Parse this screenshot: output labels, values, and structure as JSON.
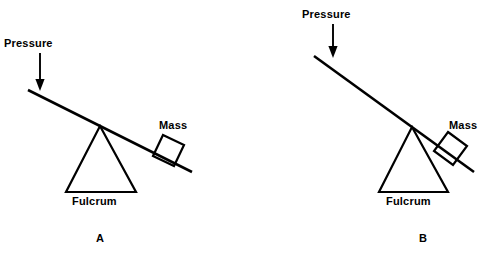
{
  "figure": {
    "background_color": "#ffffff",
    "ink_color": "#000000"
  },
  "panels": [
    {
      "id": "A",
      "letter": "A",
      "labels": {
        "pressure": "Pressure",
        "mass": "Mass",
        "fulcrum": "Fulcrum"
      }
    },
    {
      "id": "B",
      "letter": "B",
      "labels": {
        "pressure": "Pressure",
        "mass": "Mass",
        "fulcrum": "Fulcrum"
      }
    }
  ],
  "geometry": {
    "panel_a": {
      "beam": {
        "x1": 28,
        "y1": 90,
        "x2": 192,
        "y2": 172
      },
      "fulcrum_apex": {
        "x": 100,
        "y": 126
      },
      "fulcrum_base_left": {
        "x": 66,
        "y": 192
      },
      "fulcrum_base_right": {
        "x": 136,
        "y": 192
      },
      "arrow_shaft": {
        "x1": 40,
        "y1": 54,
        "x2": 40,
        "y2": 88
      },
      "mass_box_center": {
        "x": 171,
        "y": 150
      },
      "mass_box_size": 24,
      "mass_box_rotation_deg": 27
    },
    "panel_b": {
      "beam": {
        "x1": 314,
        "y1": 56,
        "x2": 474,
        "y2": 172
      },
      "fulcrum_apex": {
        "x": 412,
        "y": 127
      },
      "fulcrum_base_left": {
        "x": 379,
        "y": 192
      },
      "fulcrum_base_right": {
        "x": 448,
        "y": 192
      },
      "arrow_shaft": {
        "x1": 333,
        "y1": 22,
        "x2": 333,
        "y2": 56
      },
      "mass_box_center": {
        "x": 455,
        "y": 150
      },
      "mass_box_size": 24,
      "mass_box_rotation_deg": 36
    }
  }
}
